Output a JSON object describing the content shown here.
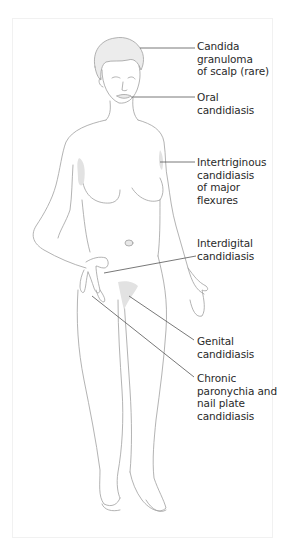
{
  "figure": {
    "type": "anatomical-illustration",
    "colors": {
      "outline": "#9a9a9a",
      "skin": "#ffffff",
      "lesion_shading": "#e3e3e3",
      "hair": "#ececec",
      "leader_line": "#555555",
      "label_text": "#2a2a2a"
    }
  },
  "labels": [
    {
      "id": "scalp",
      "text": "Candida\ngranuloma\nof scalp (rare)",
      "top": 40
    },
    {
      "id": "oral",
      "text": "Oral\ncandidiasis",
      "top": 91
    },
    {
      "id": "intertriginous",
      "text": "Intertriginous\ncandidiasis\nof major\nflexures",
      "top": 156
    },
    {
      "id": "interdigital",
      "text": "Interdigital\ncandidiasis",
      "top": 237
    },
    {
      "id": "genital",
      "text": "Genital\ncandidiasis",
      "top": 335
    },
    {
      "id": "paronychia",
      "text": "Chronic\nparonychia and\nnail plate\ncandidiasis",
      "top": 372
    }
  ]
}
